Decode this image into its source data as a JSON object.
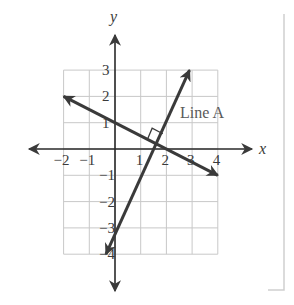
{
  "figure": {
    "axes": {
      "x_label": "x",
      "y_label": "y"
    },
    "x_ticks": [
      {
        "value": -2,
        "label": "−2"
      },
      {
        "value": -1,
        "label": "−1"
      },
      {
        "value": 1,
        "label": "1"
      },
      {
        "value": 2,
        "label": "2"
      },
      {
        "value": 3,
        "label": "3"
      },
      {
        "value": 4,
        "label": "4"
      }
    ],
    "y_ticks": [
      {
        "value": 3,
        "label": "3"
      },
      {
        "value": 2,
        "label": "2"
      },
      {
        "value": 1,
        "label": "1"
      },
      {
        "value": -1,
        "label": "−1"
      },
      {
        "value": -2,
        "label": "−2"
      },
      {
        "value": -3,
        "label": "−3"
      },
      {
        "value": -4,
        "label": "−4"
      }
    ],
    "grid": {
      "x_range": [
        -2,
        4
      ],
      "y_range": [
        -4,
        3
      ]
    },
    "lines": [
      {
        "name": "Line A",
        "label": "Line A",
        "from": [
          -0.35,
          -4
        ],
        "to": [
          2.9,
          3
        ],
        "slope": 2
      },
      {
        "name": "Line B",
        "label": "",
        "from": [
          -2,
          2
        ],
        "to": [
          4,
          -1
        ],
        "slope": -0.5
      }
    ],
    "right_angle_marker": {
      "at": [
        1.68,
        0.16
      ],
      "note": "perpendicular lines"
    },
    "colors": {
      "line": "#3a3a3a",
      "grid": "#c8c8c8",
      "frame": "#cccccc"
    }
  }
}
